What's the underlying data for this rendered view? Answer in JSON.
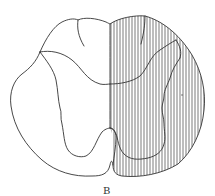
{
  "figure": {
    "hatched_side": "right",
    "stroke_color": "#333333",
    "hatch_color": "#444444",
    "background": "#ffffff"
  },
  "label": "B"
}
